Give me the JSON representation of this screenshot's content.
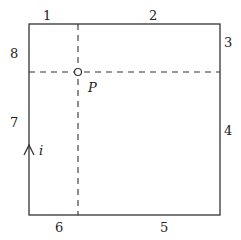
{
  "diagram": {
    "colors": {
      "stroke": "#333333",
      "background": "#ffffff"
    },
    "rectangle": {
      "x": 29,
      "y": 24,
      "width": 191,
      "height": 191
    },
    "dashed_lines": {
      "vertical_x": 78,
      "horizontal_y": 72
    },
    "point": {
      "label": "P",
      "x": 78,
      "y": 72
    },
    "edge_labels": [
      {
        "text": "1",
        "x": 46,
        "y": 21
      },
      {
        "text": "2",
        "x": 152,
        "y": 21
      },
      {
        "text": "3",
        "x": 226,
        "y": 46
      },
      {
        "text": "4",
        "x": 226,
        "y": 135
      },
      {
        "text": "5",
        "x": 160,
        "y": 231
      },
      {
        "text": "6",
        "x": 58,
        "y": 231
      },
      {
        "text": "7",
        "x": 12,
        "y": 127
      },
      {
        "text": "8",
        "x": 12,
        "y": 57
      }
    ],
    "current_arrow": {
      "label": "i",
      "x": 29,
      "y": 150
    }
  }
}
